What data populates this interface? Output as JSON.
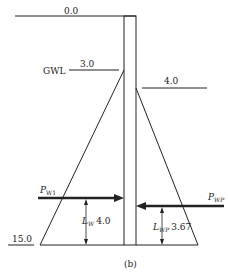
{
  "diagram": {
    "caption": "(b)",
    "labels": {
      "top_level": "0.0",
      "gwl": "GWL",
      "gwl_depth": "3.0",
      "passive_level": "4.0",
      "bottom_level": "15.0",
      "pw1_main": "P",
      "pw1_sub": "W1",
      "pwp_main": "P",
      "pwp_sub": "WP",
      "lw_main": "L",
      "lw_sub": "W",
      "lw_value": "4.0",
      "lwp_main": "L",
      "lwp_sub": "WP",
      "lwp_value": "3.67"
    },
    "colors": {
      "line": "#222222",
      "background": "#ffffff"
    }
  }
}
